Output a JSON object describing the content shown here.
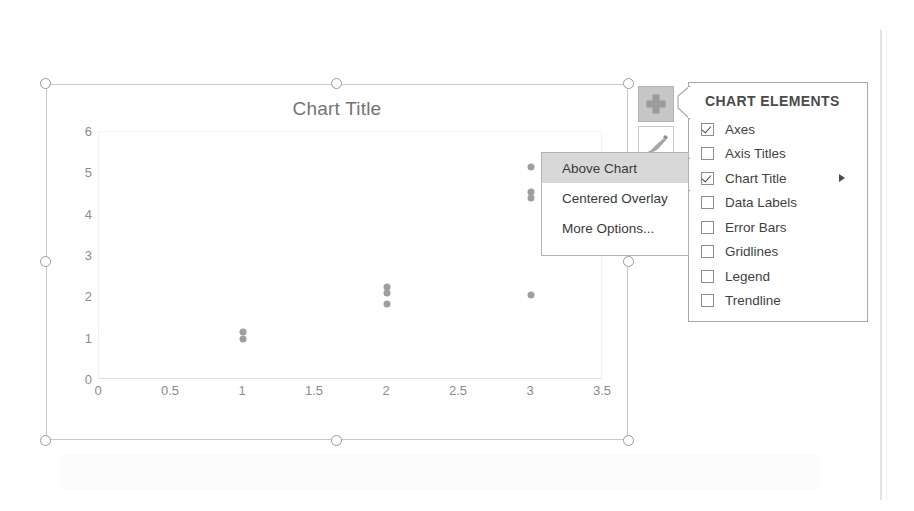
{
  "chart": {
    "title": "Chart Title",
    "plus_button_icon": "plus-icon",
    "brush_button_icon": "brush-icon"
  },
  "chart_data": {
    "type": "scatter",
    "title": "Chart Title",
    "xlabel": "",
    "ylabel": "",
    "xlim": [
      0,
      3.5
    ],
    "ylim": [
      0,
      6
    ],
    "xticks": [
      "0",
      "0.5",
      "1",
      "1.5",
      "2",
      "2.5",
      "3",
      "3.5"
    ],
    "xtick_values": [
      0,
      0.5,
      1,
      1.5,
      2,
      2.5,
      3,
      3.5
    ],
    "yticks": [
      "0",
      "1",
      "2",
      "3",
      "4",
      "5",
      "6"
    ],
    "ytick_values": [
      0,
      1,
      2,
      3,
      4,
      5,
      6
    ],
    "grid": false,
    "legend": false,
    "marker_color": "#9e9e9e",
    "points": [
      {
        "x": 1,
        "y": 1.15
      },
      {
        "x": 1,
        "y": 1.0
      },
      {
        "x": 2,
        "y": 2.25
      },
      {
        "x": 2,
        "y": 2.1
      },
      {
        "x": 2,
        "y": 1.85
      },
      {
        "x": 3,
        "y": 5.15
      },
      {
        "x": 3,
        "y": 4.55
      },
      {
        "x": 3,
        "y": 4.4
      },
      {
        "x": 3,
        "y": 2.05
      }
    ]
  },
  "chart_elements_panel": {
    "heading": "CHART ELEMENTS",
    "items": [
      {
        "label": "Axes",
        "checked": true,
        "submenu": false
      },
      {
        "label": "Axis Titles",
        "checked": false,
        "submenu": false
      },
      {
        "label": "Chart Title",
        "checked": true,
        "submenu": true
      },
      {
        "label": "Data Labels",
        "checked": false,
        "submenu": false
      },
      {
        "label": "Error Bars",
        "checked": false,
        "submenu": false
      },
      {
        "label": "Gridlines",
        "checked": false,
        "submenu": false
      },
      {
        "label": "Legend",
        "checked": false,
        "submenu": false
      },
      {
        "label": "Trendline",
        "checked": false,
        "submenu": false
      }
    ]
  },
  "title_submenu": {
    "items": [
      {
        "label": "Above Chart",
        "highlighted": true
      },
      {
        "label": "Centered Overlay",
        "highlighted": false
      },
      {
        "label": "More Options...",
        "highlighted": false
      }
    ]
  },
  "colors": {
    "selection_handle": "#9a9a9a",
    "menu_highlight": "#d8d8d8",
    "plus_button_bg": "#c6c6c6",
    "axis_text": "#8c8c8c",
    "title_text": "#747474"
  }
}
